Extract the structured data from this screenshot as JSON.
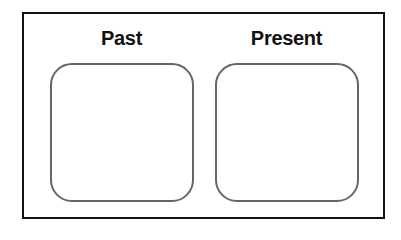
{
  "diagram": {
    "panels": [
      {
        "label": "Past"
      },
      {
        "label": "Present"
      }
    ],
    "colors": {
      "frame_border": "#111111",
      "box_border": "#666666",
      "background": "#ffffff"
    }
  }
}
